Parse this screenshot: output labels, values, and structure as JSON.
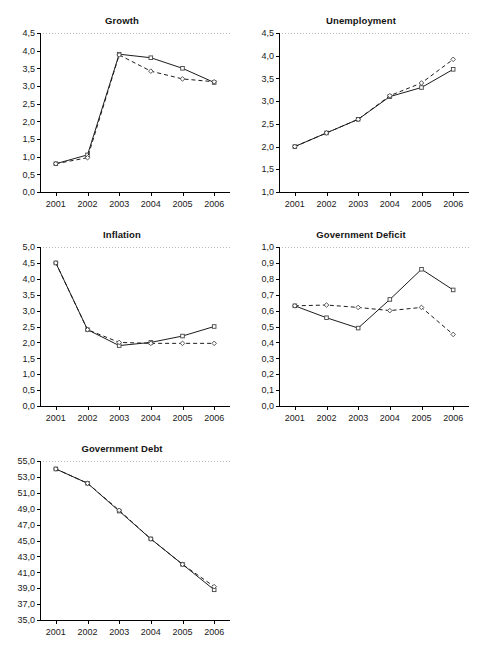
{
  "figure": {
    "background": "#ffffff",
    "line_color": "#1c1c1c",
    "marker_face": "#ffffff",
    "topline_color": "#b9b9b9"
  },
  "panels": [
    {
      "id": "growth",
      "title": "Growth",
      "chart_data": {
        "type": "line",
        "title": "Growth",
        "xlabel": "",
        "ylabel": "",
        "categories": [
          "2001",
          "2002",
          "2003",
          "2004",
          "2005",
          "2006"
        ],
        "x": [
          2001,
          2002,
          2003,
          2004,
          2005,
          2006
        ],
        "ylim": [
          0.0,
          4.5
        ],
        "ytick_values": [
          0.0,
          0.5,
          1.0,
          1.5,
          2.0,
          2.5,
          3.0,
          3.5,
          4.0,
          4.5
        ],
        "ytick_labels": [
          "0,0",
          "0,5",
          "1,0",
          "1,5",
          "2,0",
          "2,5",
          "3,0",
          "3,5",
          "4,0",
          "4,5"
        ],
        "grid": false,
        "legend": "none",
        "series": [
          {
            "name": "solid",
            "style": "solid",
            "marker": "square",
            "values": [
              0.8,
              1.05,
              3.9,
              3.8,
              3.5,
              3.1
            ]
          },
          {
            "name": "dashed",
            "style": "dashed",
            "marker": "diamond",
            "values": [
              0.8,
              0.97,
              3.88,
              3.42,
              3.2,
              3.12
            ]
          }
        ]
      }
    },
    {
      "id": "unemployment",
      "title": "Unemployment",
      "chart_data": {
        "type": "line",
        "title": "Unemployment",
        "xlabel": "",
        "ylabel": "",
        "categories": [
          "2001",
          "2002",
          "2003",
          "2004",
          "2005",
          "2006"
        ],
        "x": [
          2001,
          2002,
          2003,
          2004,
          2005,
          2006
        ],
        "ylim": [
          1.0,
          4.5
        ],
        "ytick_values": [
          1.0,
          1.5,
          2.0,
          2.5,
          3.0,
          3.5,
          4.0,
          4.5
        ],
        "ytick_labels": [
          "1,0",
          "1,5",
          "2,0",
          "2,5",
          "3,0",
          "3,5",
          "4,0",
          "4,5"
        ],
        "grid": false,
        "legend": "none",
        "series": [
          {
            "name": "solid",
            "style": "solid",
            "marker": "square",
            "values": [
              2.0,
              2.3,
              2.6,
              3.1,
              3.3,
              3.7
            ]
          },
          {
            "name": "dashed",
            "style": "dashed",
            "marker": "diamond",
            "values": [
              2.0,
              2.3,
              2.6,
              3.12,
              3.4,
              3.92
            ]
          }
        ]
      }
    },
    {
      "id": "inflation",
      "title": "Inflation",
      "chart_data": {
        "type": "line",
        "title": "Inflation",
        "xlabel": "",
        "ylabel": "",
        "categories": [
          "2001",
          "2002",
          "2003",
          "2004",
          "2005",
          "2006"
        ],
        "x": [
          2001,
          2002,
          2003,
          2004,
          2005,
          2006
        ],
        "ylim": [
          0.0,
          5.0
        ],
        "ytick_values": [
          0.0,
          0.5,
          1.0,
          1.5,
          2.0,
          2.5,
          3.0,
          3.5,
          4.0,
          4.5,
          5.0
        ],
        "ytick_labels": [
          "0,0",
          "0,5",
          "1,0",
          "1,5",
          "2,0",
          "2,5",
          "3,0",
          "3,5",
          "4,0",
          "4,5",
          "5,0"
        ],
        "grid": false,
        "legend": "none",
        "series": [
          {
            "name": "solid",
            "style": "solid",
            "marker": "square",
            "values": [
              4.5,
              2.4,
              1.9,
              2.0,
              2.2,
              2.5
            ]
          },
          {
            "name": "dashed",
            "style": "dashed",
            "marker": "diamond",
            "values": [
              4.5,
              2.4,
              2.0,
              1.97,
              1.97,
              1.97
            ]
          }
        ]
      }
    },
    {
      "id": "government-deficit",
      "title": "Government Deficit",
      "chart_data": {
        "type": "line",
        "title": "Government Deficit",
        "xlabel": "",
        "ylabel": "",
        "categories": [
          "2001",
          "2002",
          "2003",
          "2004",
          "2005",
          "2006"
        ],
        "x": [
          2001,
          2002,
          2003,
          2004,
          2005,
          2006
        ],
        "ylim": [
          0.0,
          1.0
        ],
        "ytick_values": [
          0.0,
          0.1,
          0.2,
          0.3,
          0.4,
          0.5,
          0.6,
          0.7,
          0.8,
          0.9,
          1.0
        ],
        "ytick_labels": [
          "0,0",
          "0,1",
          "0,2",
          "0,3",
          "0,4",
          "0,5",
          "0,6",
          "0,7",
          "0,8",
          "0,9",
          "1,0"
        ],
        "grid": false,
        "legend": "none",
        "series": [
          {
            "name": "solid",
            "style": "solid",
            "marker": "square",
            "values": [
              0.63,
              0.555,
              0.49,
              0.67,
              0.86,
              0.73
            ]
          },
          {
            "name": "dashed",
            "style": "dashed",
            "marker": "diamond",
            "values": [
              0.63,
              0.635,
              0.62,
              0.6,
              0.62,
              0.45
            ]
          }
        ]
      }
    },
    {
      "id": "government-debt",
      "title": "Government Debt",
      "chart_data": {
        "type": "line",
        "title": "Government Debt",
        "xlabel": "",
        "ylabel": "",
        "categories": [
          "2001",
          "2002",
          "2003",
          "2004",
          "2005",
          "2006"
        ],
        "x": [
          2001,
          2002,
          2003,
          2004,
          2005,
          2006
        ],
        "ylim": [
          35.0,
          55.0
        ],
        "ytick_values": [
          35.0,
          37.0,
          39.0,
          41.0,
          43.0,
          45.0,
          47.0,
          49.0,
          51.0,
          53.0,
          55.0
        ],
        "ytick_labels": [
          "35,0",
          "37,0",
          "39,0",
          "41,0",
          "43,0",
          "45,0",
          "47,0",
          "49,0",
          "51,0",
          "53,0",
          "55,0"
        ],
        "grid": false,
        "legend": "none",
        "series": [
          {
            "name": "solid",
            "style": "solid",
            "marker": "square",
            "values": [
              54.0,
              52.2,
              48.7,
              45.2,
              42.0,
              38.8
            ]
          },
          {
            "name": "dashed",
            "style": "dashed",
            "marker": "diamond",
            "values": [
              54.0,
              52.2,
              48.8,
              45.2,
              42.0,
              39.2
            ]
          }
        ]
      }
    }
  ],
  "layout": {
    "positions": [
      {
        "id": "growth",
        "left": 6,
        "top": 14,
        "width": 232,
        "height": 204
      },
      {
        "id": "unemployment",
        "left": 245,
        "top": 14,
        "width": 232,
        "height": 204
      },
      {
        "id": "inflation",
        "left": 6,
        "top": 228,
        "width": 232,
        "height": 204
      },
      {
        "id": "government-deficit",
        "left": 245,
        "top": 228,
        "width": 232,
        "height": 204
      },
      {
        "id": "government-debt",
        "left": 6,
        "top": 442,
        "width": 232,
        "height": 204
      }
    ]
  }
}
